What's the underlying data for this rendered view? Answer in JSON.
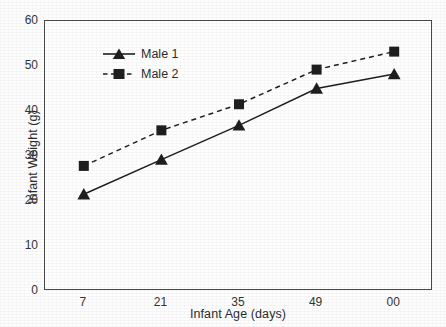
{
  "chart_data": {
    "type": "line",
    "title": "",
    "xlabel": "Infant Age (days)",
    "ylabel": "Infant Weight (g)",
    "x": [
      7,
      21,
      35,
      49,
      63
    ],
    "xtick_labels": [
      "7",
      "21",
      "35",
      "49",
      "00"
    ],
    "ytick_labels": [
      "0",
      "10",
      "20",
      "30",
      "40",
      "50",
      "60"
    ],
    "yticks": [
      0,
      10,
      20,
      30,
      40,
      50,
      60
    ],
    "xlim": [
      0,
      70
    ],
    "ylim": [
      0,
      60
    ],
    "grid": false,
    "legend_position": "top-left",
    "series": [
      {
        "name": "Male 1",
        "values": [
          21.5,
          29.2,
          36.8,
          45.0,
          48.2
        ],
        "marker": "triangle",
        "linestyle": "solid",
        "color": "#1f1f1f"
      },
      {
        "name": "Male 2",
        "values": [
          27.8,
          35.7,
          41.5,
          49.2,
          53.2
        ],
        "marker": "square",
        "linestyle": "dashed",
        "color": "#1f1f1f"
      }
    ]
  },
  "legend": {
    "items": [
      {
        "label": "Male 1"
      },
      {
        "label": "Male 2"
      }
    ]
  },
  "colors": {
    "series_1": "#1f1f1f",
    "series_2": "#1f1f1f",
    "axis": "#4a4a4a",
    "text": "#2d2d2d",
    "background": "#ffffff"
  }
}
